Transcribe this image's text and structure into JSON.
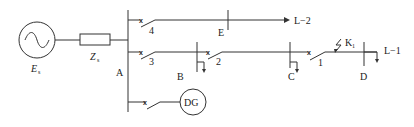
{
  "diagram": {
    "source": {
      "label": "E",
      "subscript": "s"
    },
    "impedance": {
      "label": "Z",
      "subscript": "s"
    },
    "buses": {
      "A": "A",
      "B": "B",
      "C": "C",
      "D": "D",
      "E": "E"
    },
    "breakers": {
      "b1": "1",
      "b2": "2",
      "b3": "3",
      "b4": "4"
    },
    "breaker_mark": "x",
    "lines": {
      "L1": "L−1",
      "L2": "L−2"
    },
    "fault": {
      "label": "K",
      "subscript": "1"
    },
    "dg": {
      "label": "DG"
    }
  }
}
